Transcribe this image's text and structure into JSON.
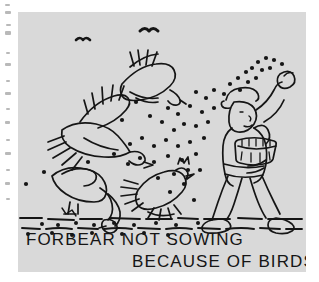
{
  "plate": {
    "kind": "emblem-line-drawing",
    "background_color": "#d9d9d9",
    "ink_color": "#151515",
    "page_color": "#ffffff",
    "scene_description": "A sower walks to the right scattering seed from a raised hand while carrying a basket of grain; gulls fly overhead and birds feed on the ground along a dashed furrow.",
    "caption": {
      "line1": "FORBEAR NOT SOWING",
      "line2": "BECAUSE OF BIRDS."
    },
    "figures": {
      "sower": "sower-figure",
      "seed_basket": "seed-basket",
      "flying_birds": 2,
      "distant_birds": 2,
      "ground_birds": 2
    }
  }
}
